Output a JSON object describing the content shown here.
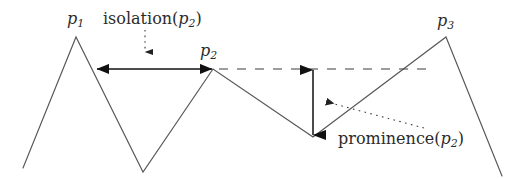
{
  "figure": {
    "name": "isolation-and-prominence-diagram",
    "background_color": "#ffffff",
    "stroke_color": "#4a4a4a",
    "arrow_color": "#1a1a1a",
    "text_color": "#2b2b2b",
    "width": 522,
    "height": 179
  },
  "labels": {
    "p1": {
      "base": "p",
      "sub": "1",
      "text": "p₁"
    },
    "p2": {
      "base": "p",
      "sub": "2",
      "text": "p₂"
    },
    "p3": {
      "base": "p",
      "sub": "3",
      "text": "p₃"
    },
    "isolation": {
      "prefix": "isolation(",
      "base": "p",
      "sub": "2",
      "suffix": ")",
      "text": "isolation(p₂)"
    },
    "prominence": {
      "prefix": "prominence(",
      "base": "p",
      "sub": "2",
      "suffix": ")",
      "text": "prominence(p₂)"
    }
  },
  "chart_data": {
    "type": "line",
    "title": "",
    "xlabel": "",
    "ylabel": "",
    "grid": false,
    "legend": "none",
    "terrain_profile": {
      "name": "terrain-polyline",
      "points": [
        [
          23,
          168
        ],
        [
          76,
          37
        ],
        [
          143,
          172
        ],
        [
          213,
          69
        ],
        [
          313,
          137
        ],
        [
          446,
          37
        ],
        [
          502,
          176
        ]
      ]
    },
    "peaks": [
      {
        "id": "p1",
        "label": "p₁",
        "x": 76,
        "y": 37
      },
      {
        "id": "p2",
        "label": "p₂",
        "x": 213,
        "y": 69
      },
      {
        "id": "p3",
        "label": "p₃",
        "x": 446,
        "y": 37
      }
    ],
    "valleys": [
      {
        "x": 143,
        "y": 172
      },
      {
        "x": 313,
        "y": 137
      }
    ],
    "annotations": [
      {
        "id": "isolation-arrow",
        "type": "double-headed-horizontal-arrow",
        "label": "isolation(p₂)",
        "from": [
          96,
          69
        ],
        "to": [
          213,
          69
        ]
      },
      {
        "id": "prominence-arrow",
        "type": "double-headed-vertical-arrow",
        "label": "prominence(p₂)",
        "from": [
          313,
          69
        ],
        "to": [
          313,
          136
        ]
      },
      {
        "id": "key-col-dashed-line",
        "type": "dashed-horizontal-line",
        "from": [
          218,
          69
        ],
        "to": [
          430,
          69
        ]
      },
      {
        "id": "isolation-leader",
        "type": "dotted-leader-arrow",
        "from": [
          145,
          31
        ],
        "to": [
          145,
          58
        ]
      },
      {
        "id": "prominence-leader",
        "type": "dotted-leader-arrow",
        "from": [
          424,
          129
        ],
        "to": [
          321,
          100
        ]
      }
    ]
  }
}
